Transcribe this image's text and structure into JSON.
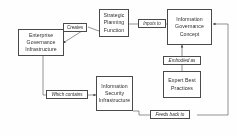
{
  "diagram": {
    "background_color": "#fefefe",
    "line_color": "#4a4a4a",
    "text_color": "#2e2e2e",
    "nodes": [
      {
        "id": "enterprise-governance-infrastructure",
        "lines": [
          "Enterprise",
          "Governance",
          "Infrastructure"
        ]
      },
      {
        "id": "strategic-planning-function",
        "lines": [
          "Strategic",
          "Planning",
          "Function"
        ]
      },
      {
        "id": "information-governance-concept",
        "lines": [
          "Information",
          "Governance",
          "Concept"
        ]
      },
      {
        "id": "information-security-infrastructure",
        "lines": [
          "Information",
          "Security",
          "Infrastructure"
        ]
      },
      {
        "id": "expert-best-practices",
        "lines": [
          "Expert Best",
          "Practices"
        ]
      }
    ],
    "edge_labels": [
      {
        "id": "creates",
        "text": "Creates"
      },
      {
        "id": "inputs-to",
        "text": "Inputs to"
      },
      {
        "id": "embodied-as",
        "text": "Embodied as"
      },
      {
        "id": "which-contains",
        "text": "Which contains"
      },
      {
        "id": "feeds-back-to",
        "text": "Feeds back to"
      }
    ]
  }
}
